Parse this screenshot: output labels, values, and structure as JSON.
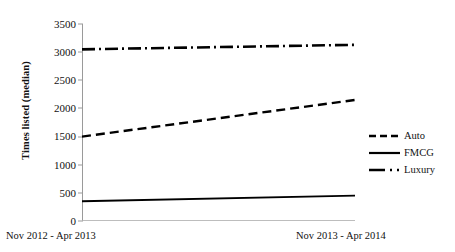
{
  "chart_data": {
    "type": "line",
    "title": "",
    "xlabel": "",
    "ylabel": "Times listed (median)",
    "categories": [
      "Nov 2012 - Apr 2013",
      "Nov 2013 - Apr 2014"
    ],
    "ylim": [
      0,
      3500
    ],
    "yticks": [
      0,
      500,
      1000,
      1500,
      2000,
      2500,
      3000,
      3500
    ],
    "ytick_labels": [
      "0",
      "500",
      "1000",
      "1500",
      "2000",
      "2500",
      "3000",
      "3500"
    ],
    "grid": false,
    "legend_position": "right",
    "series": [
      {
        "name": "Auto",
        "values": [
          1500,
          2150
        ],
        "style": "dashed",
        "color": "#000000"
      },
      {
        "name": "FMCG",
        "values": [
          350,
          450
        ],
        "style": "solid",
        "color": "#000000"
      },
      {
        "name": "Luxury",
        "values": [
          3050,
          3130
        ],
        "style": "dash-dot",
        "color": "#000000"
      }
    ]
  },
  "axis": {
    "y_title": "Times listed (median)",
    "y_labels": [
      "3500",
      "3000",
      "2500",
      "2000",
      "1500",
      "1000",
      "500",
      "0"
    ],
    "x_left_label": "Nov 2012 - Apr 2013",
    "x_right_label": "Nov 2013 - Apr 2014"
  },
  "legend": {
    "items": [
      {
        "label": "Auto"
      },
      {
        "label": "FMCG"
      },
      {
        "label": "Luxury"
      }
    ]
  }
}
